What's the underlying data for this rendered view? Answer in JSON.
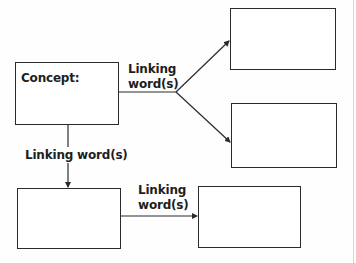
{
  "diagram": {
    "type": "concept-map",
    "colors": {
      "stroke": "#2a2a2a",
      "text": "#1e1e1e",
      "background": "#ffffff",
      "edge_rule": "#d6d6d6"
    },
    "nodes": [
      {
        "id": "concept",
        "label": "Concept:"
      },
      {
        "id": "top-right",
        "label": ""
      },
      {
        "id": "middle-right",
        "label": ""
      },
      {
        "id": "bottom-left",
        "label": ""
      },
      {
        "id": "bottom-right",
        "label": ""
      }
    ],
    "links": [
      {
        "from": "concept",
        "to": [
          "top-right",
          "middle-right"
        ],
        "label_line1": "Linking",
        "label_line2": "word(s)"
      },
      {
        "from": "concept",
        "to": "bottom-left",
        "label": "Linking word(s)"
      },
      {
        "from": "bottom-left",
        "to": "bottom-right",
        "label_line1": "Linking",
        "label_line2": "word(s)"
      }
    ]
  }
}
